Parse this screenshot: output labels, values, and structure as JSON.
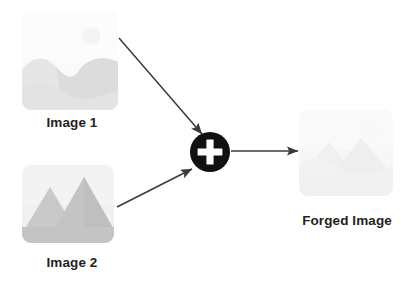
{
  "diagram": {
    "background_color": "#ffffff",
    "nodes": [
      {
        "id": "image1",
        "label": "Image 1",
        "icon": "landscape-photo-icon",
        "description": "Rolling hills landscape thumbnail with faint sun",
        "fill_color": "#f2f2f2",
        "detail_color": "#e0e0e0"
      },
      {
        "id": "image2",
        "label": "Image 2",
        "icon": "mountains-photo-icon",
        "description": "Two triangular mountain peaks thumbnail",
        "fill_color": "#ededed",
        "detail_color": "#c9c9c9"
      },
      {
        "id": "operator",
        "label": "+",
        "icon": "plus-circle-icon",
        "description": "Addition / splice operator",
        "fill_color": "#111111",
        "detail_color": "#ffffff"
      },
      {
        "id": "forged",
        "label": "Forged Image",
        "icon": "composite-photo-icon",
        "description": "Composite forged landscape thumbnail",
        "fill_color": "#f7f7f7",
        "detail_color": "#f0f0f0"
      }
    ],
    "edges": [
      {
        "id": "edge-image1-operator",
        "from": "image1",
        "to": "operator",
        "style": "arrow",
        "color": "#3a3a3a"
      },
      {
        "id": "edge-image2-operator",
        "from": "image2",
        "to": "operator",
        "style": "arrow",
        "color": "#3a3a3a"
      },
      {
        "id": "edge-operator-forged",
        "from": "operator",
        "to": "forged",
        "style": "arrow",
        "color": "#3a3a3a"
      }
    ],
    "text_color": "#231f20"
  }
}
